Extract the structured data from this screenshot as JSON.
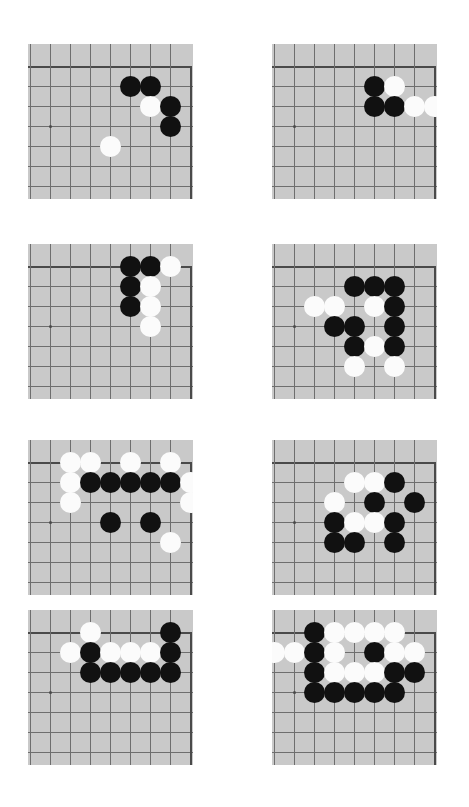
{
  "page": {
    "background_color": "#ffffff",
    "width": 469,
    "height": 807
  },
  "board_style": {
    "board_color": "#c9c9c9",
    "grid_line_color": "#6e6e6e",
    "edge_line_color": "#4a4a4a",
    "black_stone_color": "#111111",
    "white_stone_color": "#fbfbfb",
    "cell_size": 20,
    "stone_diameter": 21,
    "board_width": 165,
    "board_height": 155,
    "cols": 8,
    "rows": 7,
    "edge_top_row": 1,
    "edge_right_col": 8
  },
  "boards": [
    {
      "id": "board-1",
      "label": "diagram-1",
      "x": 28,
      "y": 44,
      "stones": [
        {
          "color": "black",
          "col": 5,
          "row": 2
        },
        {
          "color": "black",
          "col": 6,
          "row": 2
        },
        {
          "color": "white",
          "col": 6,
          "row": 3
        },
        {
          "color": "black",
          "col": 7,
          "row": 3
        },
        {
          "color": "black",
          "col": 7,
          "row": 4
        },
        {
          "color": "white",
          "col": 4,
          "row": 5
        }
      ]
    },
    {
      "id": "board-2",
      "label": "diagram-2",
      "x": 272,
      "y": 44,
      "stones": [
        {
          "color": "black",
          "col": 5,
          "row": 2
        },
        {
          "color": "white",
          "col": 6,
          "row": 2
        },
        {
          "color": "black",
          "col": 5,
          "row": 3
        },
        {
          "color": "black",
          "col": 6,
          "row": 3
        },
        {
          "color": "white",
          "col": 7,
          "row": 3
        },
        {
          "color": "white",
          "col": 8,
          "row": 3
        }
      ]
    },
    {
      "id": "board-3",
      "label": "diagram-3",
      "x": 28,
      "y": 244,
      "stones": [
        {
          "color": "black",
          "col": 5,
          "row": 1
        },
        {
          "color": "black",
          "col": 6,
          "row": 1
        },
        {
          "color": "white",
          "col": 7,
          "row": 1
        },
        {
          "color": "black",
          "col": 5,
          "row": 2
        },
        {
          "color": "white",
          "col": 6,
          "row": 2
        },
        {
          "color": "black",
          "col": 5,
          "row": 3
        },
        {
          "color": "white",
          "col": 6,
          "row": 3
        },
        {
          "color": "white",
          "col": 6,
          "row": 4
        }
      ]
    },
    {
      "id": "board-4",
      "label": "diagram-4",
      "x": 272,
      "y": 244,
      "stones": [
        {
          "color": "black",
          "col": 4,
          "row": 2
        },
        {
          "color": "black",
          "col": 5,
          "row": 2
        },
        {
          "color": "black",
          "col": 6,
          "row": 2
        },
        {
          "color": "white",
          "col": 2,
          "row": 3
        },
        {
          "color": "white",
          "col": 3,
          "row": 3
        },
        {
          "color": "white",
          "col": 5,
          "row": 3
        },
        {
          "color": "black",
          "col": 6,
          "row": 3
        },
        {
          "color": "black",
          "col": 3,
          "row": 4
        },
        {
          "color": "black",
          "col": 4,
          "row": 4
        },
        {
          "color": "black",
          "col": 6,
          "row": 4
        },
        {
          "color": "black",
          "col": 4,
          "row": 5
        },
        {
          "color": "white",
          "col": 5,
          "row": 5
        },
        {
          "color": "black",
          "col": 6,
          "row": 5
        },
        {
          "color": "white",
          "col": 4,
          "row": 6
        },
        {
          "color": "white",
          "col": 6,
          "row": 6
        }
      ]
    },
    {
      "id": "board-5",
      "label": "diagram-5",
      "x": 28,
      "y": 440,
      "stones": [
        {
          "color": "white",
          "col": 2,
          "row": 1
        },
        {
          "color": "white",
          "col": 3,
          "row": 1
        },
        {
          "color": "white",
          "col": 5,
          "row": 1
        },
        {
          "color": "white",
          "col": 7,
          "row": 1
        },
        {
          "color": "white",
          "col": 2,
          "row": 2
        },
        {
          "color": "black",
          "col": 3,
          "row": 2
        },
        {
          "color": "black",
          "col": 4,
          "row": 2
        },
        {
          "color": "black",
          "col": 5,
          "row": 2
        },
        {
          "color": "black",
          "col": 6,
          "row": 2
        },
        {
          "color": "black",
          "col": 7,
          "row": 2
        },
        {
          "color": "white",
          "col": 8,
          "row": 2
        },
        {
          "color": "white",
          "col": 2,
          "row": 3
        },
        {
          "color": "white",
          "col": 8,
          "row": 3
        },
        {
          "color": "black",
          "col": 4,
          "row": 4
        },
        {
          "color": "black",
          "col": 6,
          "row": 4
        },
        {
          "color": "white",
          "col": 7,
          "row": 5
        }
      ]
    },
    {
      "id": "board-6",
      "label": "diagram-6",
      "x": 272,
      "y": 440,
      "stones": [
        {
          "color": "white",
          "col": 4,
          "row": 2
        },
        {
          "color": "white",
          "col": 5,
          "row": 2
        },
        {
          "color": "black",
          "col": 6,
          "row": 2
        },
        {
          "color": "white",
          "col": 3,
          "row": 3
        },
        {
          "color": "black",
          "col": 5,
          "row": 3
        },
        {
          "color": "black",
          "col": 7,
          "row": 3
        },
        {
          "color": "black",
          "col": 3,
          "row": 4
        },
        {
          "color": "white",
          "col": 4,
          "row": 4
        },
        {
          "color": "white",
          "col": 5,
          "row": 4
        },
        {
          "color": "black",
          "col": 6,
          "row": 4
        },
        {
          "color": "black",
          "col": 3,
          "row": 5
        },
        {
          "color": "black",
          "col": 4,
          "row": 5
        },
        {
          "color": "black",
          "col": 6,
          "row": 5
        }
      ]
    },
    {
      "id": "board-7",
      "label": "diagram-7",
      "x": 28,
      "y": 610,
      "stones": [
        {
          "color": "white",
          "col": 3,
          "row": 1
        },
        {
          "color": "black",
          "col": 7,
          "row": 1
        },
        {
          "color": "white",
          "col": 2,
          "row": 2
        },
        {
          "color": "black",
          "col": 3,
          "row": 2
        },
        {
          "color": "white",
          "col": 4,
          "row": 2
        },
        {
          "color": "white",
          "col": 5,
          "row": 2
        },
        {
          "color": "white",
          "col": 6,
          "row": 2
        },
        {
          "color": "black",
          "col": 7,
          "row": 2
        },
        {
          "color": "black",
          "col": 3,
          "row": 3
        },
        {
          "color": "black",
          "col": 4,
          "row": 3
        },
        {
          "color": "black",
          "col": 5,
          "row": 3
        },
        {
          "color": "black",
          "col": 6,
          "row": 3
        },
        {
          "color": "black",
          "col": 7,
          "row": 3
        }
      ]
    },
    {
      "id": "board-8",
      "label": "diagram-8",
      "x": 272,
      "y": 610,
      "stones": [
        {
          "color": "black",
          "col": 2,
          "row": 1
        },
        {
          "color": "white",
          "col": 3,
          "row": 1
        },
        {
          "color": "white",
          "col": 4,
          "row": 1
        },
        {
          "color": "white",
          "col": 5,
          "row": 1
        },
        {
          "color": "white",
          "col": 6,
          "row": 1
        },
        {
          "color": "white",
          "col": 0,
          "row": 2
        },
        {
          "color": "white",
          "col": 1,
          "row": 2
        },
        {
          "color": "black",
          "col": 2,
          "row": 2
        },
        {
          "color": "white",
          "col": 3,
          "row": 2
        },
        {
          "color": "black",
          "col": 5,
          "row": 2
        },
        {
          "color": "white",
          "col": 6,
          "row": 2
        },
        {
          "color": "white",
          "col": 7,
          "row": 2
        },
        {
          "color": "black",
          "col": 2,
          "row": 3
        },
        {
          "color": "white",
          "col": 3,
          "row": 3
        },
        {
          "color": "white",
          "col": 4,
          "row": 3
        },
        {
          "color": "white",
          "col": 5,
          "row": 3
        },
        {
          "color": "black",
          "col": 6,
          "row": 3
        },
        {
          "color": "black",
          "col": 7,
          "row": 3
        },
        {
          "color": "black",
          "col": 2,
          "row": 4
        },
        {
          "color": "black",
          "col": 3,
          "row": 4
        },
        {
          "color": "black",
          "col": 4,
          "row": 4
        },
        {
          "color": "black",
          "col": 5,
          "row": 4
        },
        {
          "color": "black",
          "col": 6,
          "row": 4
        }
      ]
    }
  ]
}
